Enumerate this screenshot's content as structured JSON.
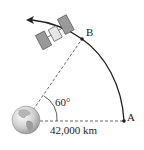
{
  "diagram": {
    "labels": {
      "point_a": "A",
      "point_b": "B",
      "angle": "60°",
      "distance": "42,000 km"
    },
    "objects": [
      "earth",
      "satellite",
      "orbit-arc",
      "radius-line-A",
      "radius-line-B"
    ],
    "colors": {
      "line": "#222222",
      "dashed": "#555555",
      "satellite_panel": "#9a9a9a",
      "satellite_body": "#e6e6e6"
    }
  }
}
